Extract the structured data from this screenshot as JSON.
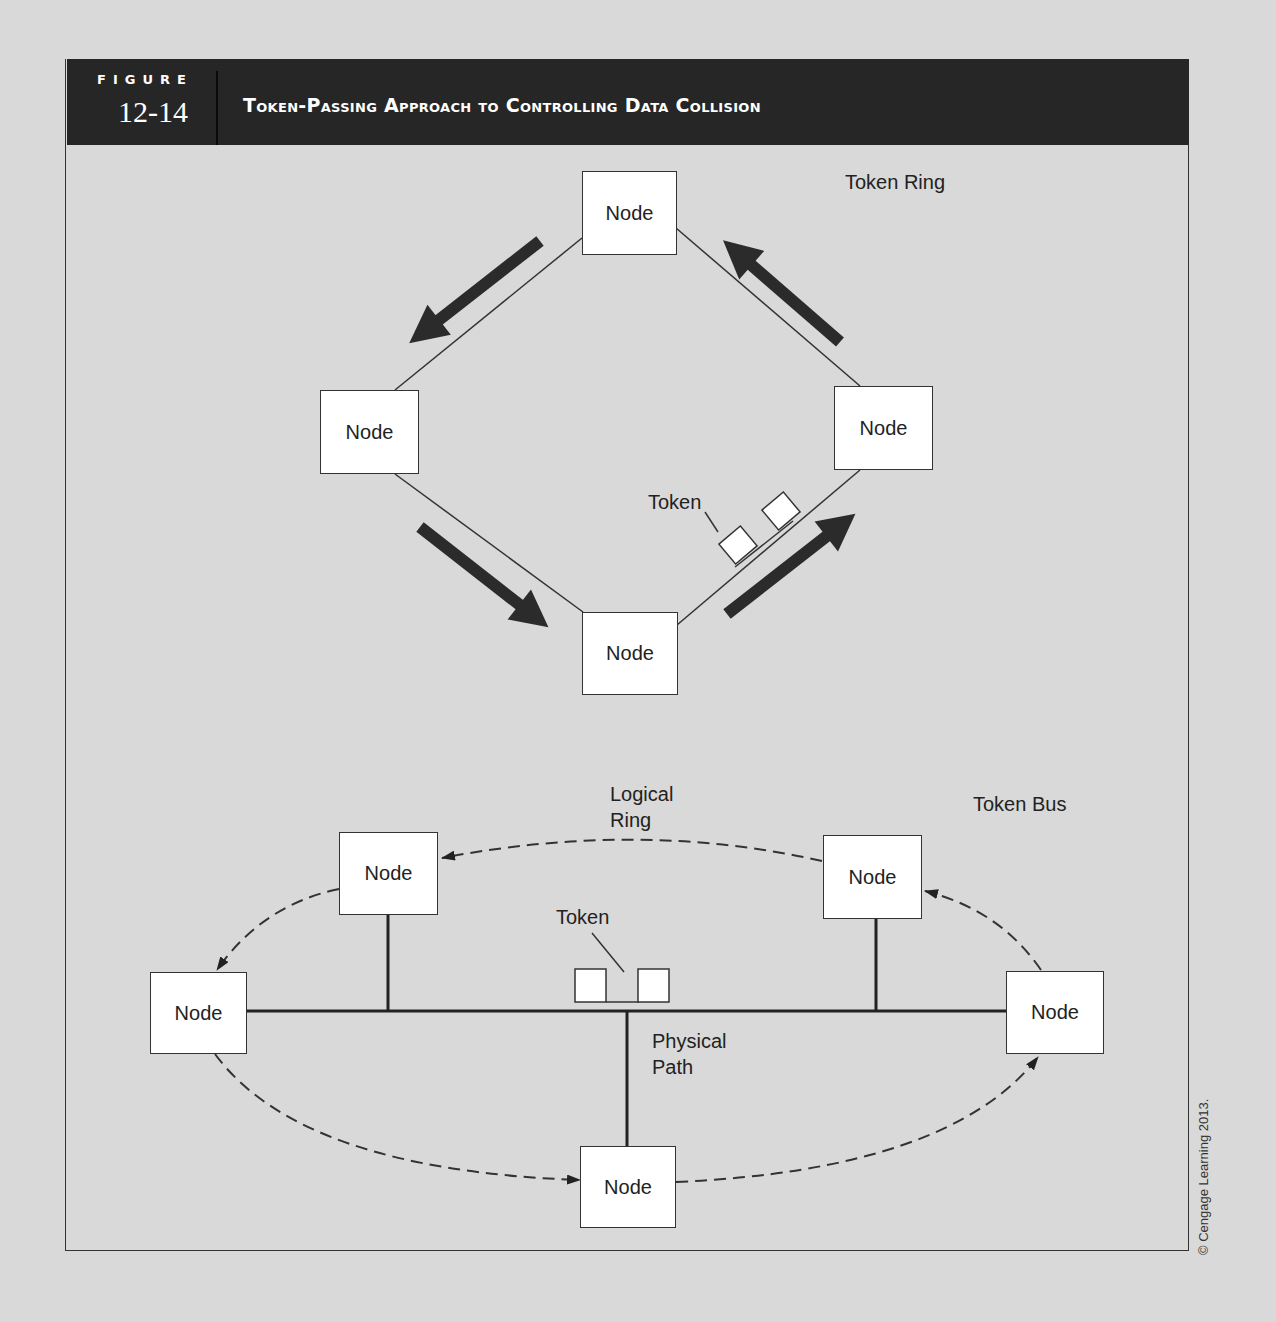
{
  "figure": {
    "label": "FIGURE",
    "number": "12-14",
    "title": "Token-Passing Approach to Controlling Data Collision"
  },
  "token_ring": {
    "title": "Token Ring",
    "nodes": [
      {
        "id": "top",
        "label": "Node"
      },
      {
        "id": "left",
        "label": "Node"
      },
      {
        "id": "right",
        "label": "Node"
      },
      {
        "id": "bottom",
        "label": "Node"
      }
    ],
    "token_label": "Token",
    "flow_direction": "counter-clockwise"
  },
  "token_bus": {
    "title": "Token Bus",
    "logical_ring_label": "Logical\nRing",
    "physical_path_label": "Physical\nPath",
    "token_label": "Token",
    "nodes": [
      {
        "id": "upper-left",
        "label": "Node"
      },
      {
        "id": "upper-right",
        "label": "Node"
      },
      {
        "id": "left",
        "label": "Node"
      },
      {
        "id": "right",
        "label": "Node"
      },
      {
        "id": "bottom",
        "label": "Node"
      }
    ]
  },
  "copyright": "© Cengage Learning 2013."
}
